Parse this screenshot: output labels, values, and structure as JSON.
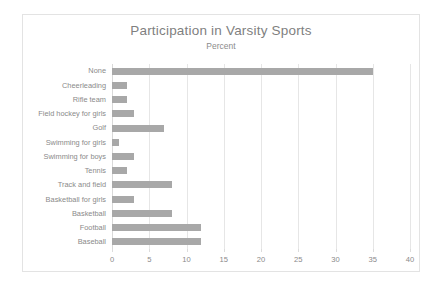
{
  "chart_data": {
    "type": "bar",
    "orientation": "horizontal",
    "title": "Participation in Varsity Sports",
    "subtitle": "Percent",
    "xlabel": "",
    "ylabel": "",
    "xlim": [
      0,
      40
    ],
    "xticks": [
      0,
      5,
      10,
      15,
      20,
      25,
      30,
      35,
      40
    ],
    "grid": "vertical",
    "legend": "none",
    "bar_color": "#a8a8a8",
    "categories": [
      "None",
      "Cheerleading",
      "Rifle team",
      "Field hockey for girls",
      "Golf",
      "Swimming for girls",
      "Swimming for boys",
      "Tennis",
      "Track and field",
      "Basketball for girls",
      "Basketball",
      "Football",
      "Baseball"
    ],
    "values": [
      35,
      2,
      2,
      3,
      7,
      1,
      3,
      2,
      8,
      3,
      8,
      12,
      12
    ]
  }
}
